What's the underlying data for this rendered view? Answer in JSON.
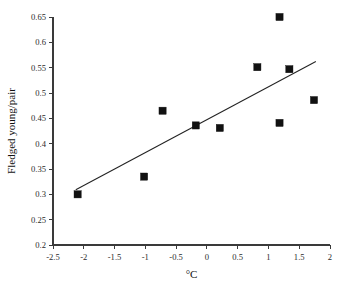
{
  "chart_data": {
    "type": "scatter",
    "title": "",
    "subtitle": "",
    "xlabel": "°C",
    "ylabel": "Fledged young/pair",
    "xlim": [
      -2.5,
      2
    ],
    "ylim": [
      0.2,
      0.65
    ],
    "grid": false,
    "legend": null,
    "legend_position": "none",
    "marker_style": "filled-square",
    "marker_color": "#111111",
    "trendline_color": "#222222",
    "axis_color": "#3a3a3a",
    "xticks": [
      -2.5,
      -2,
      -1.5,
      -1,
      -0.5,
      0,
      0.5,
      1,
      1.5,
      2
    ],
    "xtick_labels": [
      "-2.5",
      "-2",
      "-1.5",
      "-1",
      "-0.5",
      "0",
      "0.5",
      "1",
      "1.5",
      "2"
    ],
    "yticks": [
      0.2,
      0.25,
      0.3,
      0.35,
      0.4,
      0.45,
      0.5,
      0.55,
      0.6,
      0.65
    ],
    "ytick_labels": [
      "0.2",
      "0.25",
      "0.3",
      "0.35",
      "0.4",
      "0.45",
      "0.5",
      "0.55",
      "0.6",
      "0.65"
    ],
    "points": [
      {
        "x": -2.1,
        "y": 0.3
      },
      {
        "x": -1.02,
        "y": 0.335
      },
      {
        "x": -0.72,
        "y": 0.465
      },
      {
        "x": -0.18,
        "y": 0.436
      },
      {
        "x": 0.21,
        "y": 0.431
      },
      {
        "x": 0.82,
        "y": 0.551
      },
      {
        "x": 1.18,
        "y": 0.65
      },
      {
        "x": 1.18,
        "y": 0.441
      },
      {
        "x": 1.34,
        "y": 0.547
      },
      {
        "x": 1.74,
        "y": 0.486
      }
    ],
    "trendline": {
      "x1": -2.13,
      "y1": 0.309,
      "x2": 1.77,
      "y2": 0.562
    },
    "annotations": []
  }
}
